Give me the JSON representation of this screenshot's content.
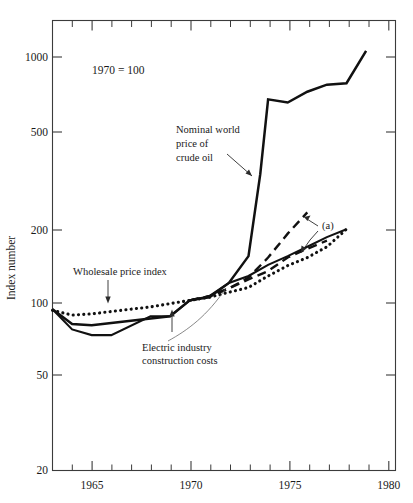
{
  "chart_data": {
    "type": "line",
    "title": "",
    "note": "1970 = 100",
    "xlabel": "",
    "ylabel": "Index  number",
    "scale": "log-y",
    "ylim": [
      20,
      1400
    ],
    "xlim": [
      1963,
      1980.5
    ],
    "grid": false,
    "legend_position": "inline-annotations",
    "y_ticks": [
      20,
      50,
      100,
      200,
      500,
      1000
    ],
    "y_tick_labels": [
      "20",
      "50",
      "100",
      "200",
      "500",
      "1000"
    ],
    "x_ticks": [
      1964,
      1965,
      1966,
      1967,
      1968,
      1969,
      1970,
      1971,
      1972,
      1973,
      1974,
      1975,
      1976,
      1977,
      1978,
      1979,
      1980
    ],
    "x_tick_labels_shown": [
      "1965",
      "1970",
      "1975",
      "1980"
    ],
    "x_labeled_ticks": [
      1965,
      1970,
      1975,
      1980
    ],
    "series": [
      {
        "name": "Nominal world price of crude oil",
        "style": "solid",
        "x": [
          1963,
          1964,
          1965,
          1969,
          1970,
          1971,
          1972,
          1973,
          1973.6,
          1974,
          1975,
          1976,
          1977,
          1978,
          1979
        ],
        "values": [
          92,
          80,
          79,
          86,
          100,
          103,
          118,
          152,
          330,
          670,
          650,
          720,
          770,
          780,
          1060
        ]
      },
      {
        "name": "Electric industry construction costs",
        "style": "solid",
        "x": [
          1963,
          1964,
          1965,
          1966,
          1968,
          1969,
          1970,
          1971,
          1972,
          1973,
          1974,
          1975,
          1976,
          1977,
          1978
        ],
        "values": [
          92,
          76,
          72,
          72,
          86,
          86,
          100,
          104,
          118,
          126,
          140,
          152,
          166,
          182,
          196
        ]
      },
      {
        "name": "Wholesale price index",
        "style": "dotted",
        "x": [
          1963,
          1964,
          1965,
          1966,
          1967,
          1968,
          1969,
          1970,
          1971,
          1972,
          1973,
          1974,
          1975,
          1976,
          1977,
          1978
        ],
        "values": [
          91,
          87,
          88,
          90,
          92,
          94,
          97,
          100,
          103,
          108,
          113,
          126,
          139,
          150,
          166,
          196
        ]
      },
      {
        "name": "(a) projection upper",
        "style": "dashed",
        "x": [
          1970,
          1971,
          1972,
          1973,
          1974,
          1975,
          1976
        ],
        "values": [
          100,
          104,
          112,
          124,
          150,
          188,
          230
        ]
      },
      {
        "name": "(a) projection lower",
        "style": "dashed",
        "x": [
          1970,
          1971,
          1972,
          1973,
          1974,
          1975,
          1976,
          1977
        ],
        "values": [
          100,
          104,
          112,
          122,
          132,
          150,
          163,
          176
        ]
      }
    ],
    "annotations": [
      {
        "id": "oil-label",
        "text": "Nominal world\nprice of\ncrude oil",
        "lines": [
          "Nominal world",
          "price of",
          "crude oil"
        ]
      },
      {
        "id": "wholesale-label",
        "text": "Wholesale price index",
        "lines": [
          "Wholesale price index"
        ]
      },
      {
        "id": "electric-label",
        "text": "Electric industry\nconstruction costs",
        "lines": [
          "Electric industry",
          "construction costs"
        ]
      },
      {
        "id": "projection-label",
        "text": "(a)",
        "lines": [
          "(a)"
        ]
      }
    ]
  },
  "axis": {
    "y_title": "Index  number",
    "y_tick_1000": "1000",
    "y_tick_500": "500",
    "y_tick_200": "200",
    "y_tick_100": "100",
    "y_tick_50": "50",
    "y_tick_20": "20",
    "x_tick_1965": "1965",
    "x_tick_1970": "1970",
    "x_tick_1975": "1975",
    "x_tick_1980": "1980"
  },
  "labels": {
    "note": "1970 = 100",
    "oil_l1": "Nominal world",
    "oil_l2": "price of",
    "oil_l3": "crude oil",
    "wholesale": "Wholesale price index",
    "electric_l1": "Electric industry",
    "electric_l2": "construction costs",
    "projection": "(a)"
  },
  "colors": {
    "ink": "#111111",
    "frame": "#3b3b3b",
    "background": "#ffffff"
  }
}
